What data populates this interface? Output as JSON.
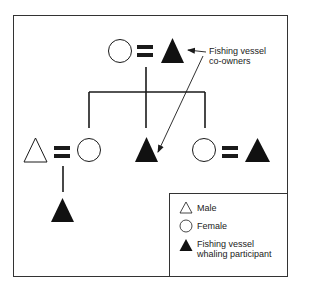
{
  "diagram": {
    "type": "kinship-chart",
    "annotation": {
      "line1": "Fishing vessel",
      "line2": "co-owners"
    },
    "nodes": [
      {
        "id": "parent-female",
        "shape": "circle",
        "fill": "open"
      },
      {
        "id": "parent-male",
        "shape": "triangle",
        "fill": "filled"
      },
      {
        "id": "child1-spouse-male",
        "shape": "triangle",
        "fill": "open"
      },
      {
        "id": "child1-female",
        "shape": "circle",
        "fill": "open"
      },
      {
        "id": "child2-male",
        "shape": "triangle",
        "fill": "filled"
      },
      {
        "id": "child3-female",
        "shape": "circle",
        "fill": "open"
      },
      {
        "id": "child3-spouse-male",
        "shape": "triangle",
        "fill": "filled"
      },
      {
        "id": "grandchild-male",
        "shape": "triangle",
        "fill": "filled"
      }
    ],
    "marriages": [
      [
        "parent-female",
        "parent-male"
      ],
      [
        "child1-spouse-male",
        "child1-female"
      ],
      [
        "child3-female",
        "child3-spouse-male"
      ]
    ]
  },
  "legend": {
    "items": [
      {
        "icon": "open-triangle-icon",
        "label": "Male"
      },
      {
        "icon": "open-circle-icon",
        "label": "Female"
      },
      {
        "icon": "filled-triangle-icon",
        "label_line1": "Fishing vessel",
        "label_line2": "whaling participant"
      }
    ]
  },
  "colors": {
    "stroke": "#1a1a1a",
    "fill": "#111111",
    "border": "#333333"
  }
}
